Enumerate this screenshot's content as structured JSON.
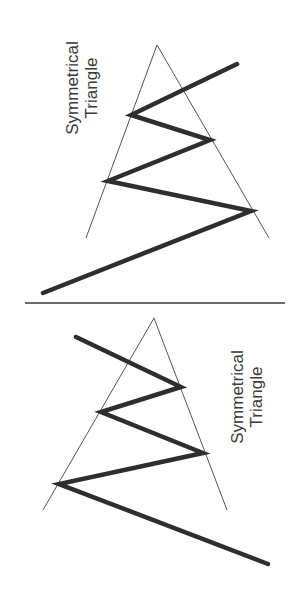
{
  "panels": [
    {
      "id": "top",
      "label": {
        "line1": "Symmetrical",
        "line2": "Triangle"
      },
      "triangle": {
        "apex": [
          157,
          45
        ],
        "left_base": [
          86,
          238
        ],
        "right_base": [
          269,
          238
        ]
      },
      "zigzag": [
        [
          43,
          293
        ],
        [
          251,
          211
        ],
        [
          108,
          181
        ],
        [
          210,
          140
        ],
        [
          131,
          115
        ],
        [
          237,
          64
        ]
      ]
    },
    {
      "id": "bottom",
      "label": {
        "line1": "Symmetrical",
        "line2": "Triangle"
      },
      "triangle": {
        "apex": [
          154,
          318
        ],
        "left_base": [
          43,
          510
        ],
        "right_base": [
          227,
          510
        ]
      },
      "zigzag": [
        [
          76,
          337
        ],
        [
          181,
          387
        ],
        [
          101,
          412
        ],
        [
          203,
          453
        ],
        [
          59,
          484
        ],
        [
          268,
          564
        ]
      ]
    }
  ],
  "divider": {
    "from": [
      25,
      303
    ],
    "to": [
      285,
      303
    ]
  },
  "colors": {
    "background": "#ffffff",
    "triangle_lines": "#555555",
    "price_line": "#2e2e2e",
    "text": "#3a3a3a"
  }
}
